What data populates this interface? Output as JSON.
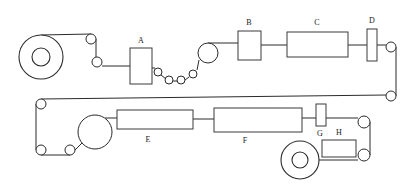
{
  "diagram": {
    "type": "process-flow-schematic",
    "background_color": "#ffffff",
    "line_color": "#2b2b2b",
    "box_fill": "#ffffff",
    "label_color": "#1a1a1a",
    "canvas": {
      "width": 414,
      "height": 196
    },
    "labels": {
      "a": "A",
      "b": "B",
      "c": "C",
      "d": "D",
      "e": "E",
      "f": "F",
      "g": "G",
      "h": "H"
    },
    "units": [
      {
        "id": "A",
        "label": "A",
        "shape": "rectangle",
        "x": 130,
        "y": 48,
        "width": 22,
        "height": 36,
        "label_x": 141,
        "label_y": 41,
        "label_position": "above"
      },
      {
        "id": "B",
        "label": "B",
        "shape": "rectangle",
        "x": 238,
        "y": 31,
        "width": 23,
        "height": 29,
        "label_x": 249,
        "label_y": 23,
        "label_position": "above"
      },
      {
        "id": "C",
        "label": "C",
        "shape": "rectangle",
        "x": 287,
        "y": 32,
        "width": 61,
        "height": 25,
        "label_x": 317,
        "label_y": 23,
        "label_position": "above"
      },
      {
        "id": "D",
        "label": "D",
        "shape": "narrow-rectangle",
        "x": 367,
        "y": 29,
        "width": 10,
        "height": 32,
        "label_x": 372,
        "label_y": 21,
        "label_position": "above"
      },
      {
        "id": "E",
        "label": "E",
        "shape": "rectangle",
        "x": 117,
        "y": 110,
        "width": 76,
        "height": 19,
        "label_x": 148,
        "label_y": 140,
        "label_position": "below"
      },
      {
        "id": "F",
        "label": "F",
        "shape": "rectangle",
        "x": 214,
        "y": 108,
        "width": 88,
        "height": 24,
        "label_x": 245,
        "label_y": 141,
        "label_position": "below"
      },
      {
        "id": "G",
        "label": "G",
        "shape": "narrow-rectangle",
        "x": 316,
        "y": 104,
        "width": 10,
        "height": 22,
        "label_x": 320,
        "label_y": 134,
        "label_position": "below"
      },
      {
        "id": "H",
        "label": "H",
        "shape": "rectangle",
        "x": 322,
        "y": 140,
        "width": 34,
        "height": 17,
        "label_x": 339,
        "label_y": 133,
        "label_position": "above"
      }
    ],
    "rolls": [
      {
        "id": "unwind-roll",
        "cx": 41,
        "cy": 57,
        "outer_radius": 22,
        "inner_radius": 9,
        "role": "unwind"
      },
      {
        "id": "rewind-roll",
        "cx": 300,
        "cy": 160,
        "outer_radius": 19,
        "inner_radius": 8,
        "role": "rewind"
      }
    ],
    "rollers": [
      {
        "id": "roller-1",
        "cx": 91,
        "cy": 39,
        "r": 5
      },
      {
        "id": "roller-2",
        "cx": 97,
        "cy": 62,
        "r": 5
      },
      {
        "id": "roller-3",
        "cx": 158,
        "cy": 72,
        "r": 4
      },
      {
        "id": "roller-4",
        "cx": 169,
        "cy": 80,
        "r": 4
      },
      {
        "id": "roller-5",
        "cx": 181,
        "cy": 80,
        "r": 4
      },
      {
        "id": "roller-6",
        "cx": 193,
        "cy": 74,
        "r": 4
      },
      {
        "id": "roller-7",
        "cx": 208,
        "cy": 53,
        "r": 10
      },
      {
        "id": "roller-8",
        "cx": 391,
        "cy": 47,
        "r": 5
      },
      {
        "id": "roller-9",
        "cx": 391,
        "cy": 96,
        "r": 5
      },
      {
        "id": "roller-10",
        "cx": 41,
        "cy": 104,
        "r": 5
      },
      {
        "id": "roller-11",
        "cx": 41,
        "cy": 150,
        "r": 5
      },
      {
        "id": "roller-12",
        "cx": 70,
        "cy": 150,
        "r": 5
      },
      {
        "id": "roller-13",
        "cx": 95,
        "cy": 132,
        "r": 17
      },
      {
        "id": "roller-14",
        "cx": 364,
        "cy": 122,
        "r": 6
      },
      {
        "id": "roller-15",
        "cx": 364,
        "cy": 155,
        "r": 6
      }
    ]
  }
}
